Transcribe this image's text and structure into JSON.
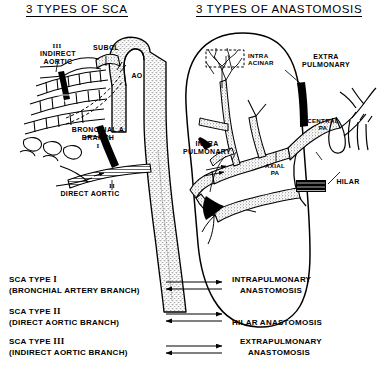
{
  "titles": {
    "left": "3 TYPES OF SCA",
    "right": "3 TYPES OF ANASTOMOSIS"
  },
  "left_panel": {
    "labels": {
      "indirect_numeral": "III",
      "indirect_line1": "INDIRECT",
      "indirect_line2": "AORTIC",
      "subclavian": "SUBCL",
      "aorta": "AO",
      "bronchial_line1": "BRONCHIAL A",
      "bronchial_line2": "BRANCH",
      "bronchial_numeral": "I",
      "direct_numeral": "II",
      "direct_label": "DIRECT AORTIC"
    }
  },
  "right_panel": {
    "labels": {
      "intra_acinar_line1": "INTRA",
      "intra_acinar_line2": "ACINAR",
      "extra_pulmonary_line1": "EXTRA",
      "extra_pulmonary_line2": "PULMONARY",
      "central_pa_line1": "CENTRAL",
      "central_pa_line2": "PA",
      "axial_pa_line1": "AXIAL",
      "axial_pa_line2": "PA",
      "intra_pulmonary_line1": "INTRA",
      "intra_pulmonary_line2": "PULMONARY",
      "hilar": "HILAR"
    }
  },
  "legend": {
    "rows": [
      {
        "sca_prefix": "SCA TYPE ",
        "sca_numeral": "I",
        "sca_detail": "(BRONCHIAL ARTERY BRANCH)",
        "anast_line1": "INTRAPULMONARY",
        "anast_line2": "ANASTOMOSIS"
      },
      {
        "sca_prefix": "SCA TYPE ",
        "sca_numeral": "II",
        "sca_detail": "(DIRECT AORTIC BRANCH)",
        "anast_line1": "HILAR ANASTOMOSIS",
        "anast_line2": ""
      },
      {
        "sca_prefix": "SCA TYPE ",
        "sca_numeral": "III",
        "sca_detail": "(INDIRECT AORTIC BRANCH)",
        "anast_line1": "EXTRAPULMONARY",
        "anast_line2": "ANASTOMOSIS"
      }
    ]
  },
  "colors": {
    "ink": "#000000",
    "paper": "#ffffff",
    "stipple": "#8a8a8a"
  }
}
